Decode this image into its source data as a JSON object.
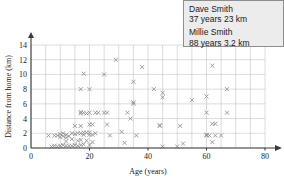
{
  "chart_data": {
    "type": "scatter",
    "title": "",
    "xlabel": "Age (years)",
    "ylabel": "Distance from home (km)",
    "xlim": [
      0,
      80
    ],
    "ylim": [
      0,
      14
    ],
    "xticks": [
      0,
      20,
      40,
      60,
      80
    ],
    "yticks": [
      0,
      2,
      4,
      6,
      8,
      10,
      12,
      14
    ],
    "xtick_labels": [
      "0",
      "20",
      "40",
      "60",
      "80"
    ],
    "ytick_labels": [
      "0",
      "2",
      "4",
      "6",
      "8",
      "10",
      "12",
      "14"
    ],
    "grid": true,
    "grid_x_step": 5,
    "grid_y_step": 2,
    "marker": "x",
    "marker_color": "#8d8d8d",
    "legend": "none",
    "points": [
      [
        6,
        1.7
      ],
      [
        7,
        0.2
      ],
      [
        8,
        1.7
      ],
      [
        8,
        0.3
      ],
      [
        9,
        1.7
      ],
      [
        9,
        0.2
      ],
      [
        10,
        1.9
      ],
      [
        10,
        1.5
      ],
      [
        10,
        0.3
      ],
      [
        11,
        1.6
      ],
      [
        11,
        2.0
      ],
      [
        11,
        0.4
      ],
      [
        12,
        1.8
      ],
      [
        12,
        1.4
      ],
      [
        12,
        0.3
      ],
      [
        12,
        0.9
      ],
      [
        13,
        1.6
      ],
      [
        13,
        0.3
      ],
      [
        14,
        2.0
      ],
      [
        14,
        1.2
      ],
      [
        14,
        0.3
      ],
      [
        15,
        3.0
      ],
      [
        15,
        1.9
      ],
      [
        15,
        0.4
      ],
      [
        16,
        2.0
      ],
      [
        16,
        1.0
      ],
      [
        16,
        0.3
      ],
      [
        17,
        8.0
      ],
      [
        17,
        4.9
      ],
      [
        17,
        4.7
      ],
      [
        17,
        3.0
      ],
      [
        17,
        2.0
      ],
      [
        17,
        1.1
      ],
      [
        17,
        0.4
      ],
      [
        18,
        10.1
      ],
      [
        18,
        4.8
      ],
      [
        18,
        2.1
      ],
      [
        18,
        1.8
      ],
      [
        18,
        0.5
      ],
      [
        19,
        4.7
      ],
      [
        19,
        2.1
      ],
      [
        19,
        1.0
      ],
      [
        20,
        8.0
      ],
      [
        20,
        4.8
      ],
      [
        20,
        3.2
      ],
      [
        20,
        2.1
      ],
      [
        20,
        1.8
      ],
      [
        20,
        0.4
      ],
      [
        21,
        3.2
      ],
      [
        21,
        1.8
      ],
      [
        21,
        0.8
      ],
      [
        22,
        4.8
      ],
      [
        22,
        2.0
      ],
      [
        23,
        4.8
      ],
      [
        25,
        10.0
      ],
      [
        25,
        4.8
      ],
      [
        26,
        3.2
      ],
      [
        26,
        4.8
      ],
      [
        27,
        1.7
      ],
      [
        29,
        12.0
      ],
      [
        31,
        2.2
      ],
      [
        32,
        0.7
      ],
      [
        33,
        4.8
      ],
      [
        34,
        4.0
      ],
      [
        35,
        6.2
      ],
      [
        35,
        6.0
      ],
      [
        35,
        9.0
      ],
      [
        36,
        1.7
      ],
      [
        38,
        11.0
      ],
      [
        42,
        8.0
      ],
      [
        44,
        3.0
      ],
      [
        44,
        3.1
      ],
      [
        45,
        7.5
      ],
      [
        45,
        6.9
      ],
      [
        45,
        0.2
      ],
      [
        50,
        0.2
      ],
      [
        51,
        3.0
      ],
      [
        52,
        0.6
      ],
      [
        55,
        6.5
      ],
      [
        60,
        7.0
      ],
      [
        60,
        4.8
      ],
      [
        60,
        1.8
      ],
      [
        60,
        1.7
      ],
      [
        61,
        1.7
      ],
      [
        62,
        11.2
      ],
      [
        62,
        3.3
      ],
      [
        62,
        0.8
      ],
      [
        63,
        3.3
      ],
      [
        63,
        1.7
      ],
      [
        65,
        1.7
      ],
      [
        67,
        8.0
      ],
      [
        67,
        4.8
      ]
    ]
  },
  "callout": {
    "person_1_name": "Dave Smith",
    "person_1_detail": "37 years 23 km",
    "person_2_name": "Millie Smith",
    "person_2_detail": "88 years 3.2 km"
  }
}
